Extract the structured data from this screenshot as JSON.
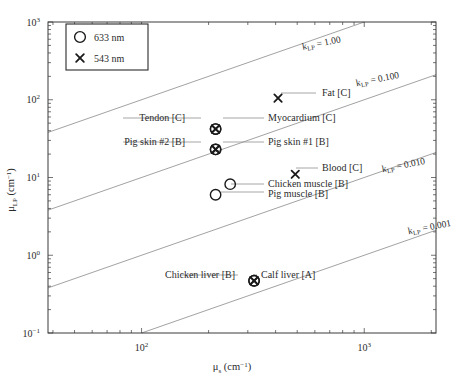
{
  "chart_data": {
    "type": "scatter",
    "title": "",
    "xlabel": "μₛ (cm⁻¹)",
    "ylabel": "μʟₚ (cm⁻¹)",
    "xlabel_parts": {
      "mu": "μ",
      "sub": "s",
      "unit": " (cm",
      "exp": "−1",
      "close": ")"
    },
    "ylabel_parts": {
      "mu": "μ",
      "sub": "LP",
      "unit": " (cm",
      "exp": "−1",
      "close": ")"
    },
    "xscale": "log",
    "yscale": "log",
    "xlim": [
      38,
      2100
    ],
    "ylim": [
      0.1,
      1000
    ],
    "grid": false,
    "xticks": [
      100,
      1000
    ],
    "xtick_labels": [
      "10²",
      "10³"
    ],
    "xtick_label_parts": [
      {
        "base": "10",
        "exp": "2"
      },
      {
        "base": "10",
        "exp": "3"
      }
    ],
    "yticks": [
      0.1,
      1,
      10,
      100,
      1000
    ],
    "ytick_labels": [
      "10⁻¹",
      "10⁰",
      "10¹",
      "10²",
      "10³"
    ],
    "ytick_label_parts": [
      {
        "base": "10",
        "exp": "−1"
      },
      {
        "base": "10",
        "exp": "0"
      },
      {
        "base": "10",
        "exp": "1"
      },
      {
        "base": "10",
        "exp": "2"
      },
      {
        "base": "10",
        "exp": "3"
      }
    ],
    "legend": {
      "position": "top-left",
      "entries": [
        {
          "marker": "circle",
          "label": "633 nm"
        },
        {
          "marker": "cross",
          "label": "543 nm"
        }
      ]
    },
    "reference_lines": [
      {
        "label": "k_LP = 1.00",
        "label_base": "k",
        "label_sub": "LP",
        "label_value": " = 1.00",
        "k": 1.0
      },
      {
        "label": "k_LP = 0.100",
        "label_base": "k",
        "label_sub": "LP",
        "label_value": " = 0.100",
        "k": 0.1
      },
      {
        "label": "k_LP = 0.010",
        "label_base": "k",
        "label_sub": "LP",
        "label_value": " = 0.010",
        "k": 0.01
      },
      {
        "label": "k_LP = 0.001",
        "label_base": "k",
        "label_sub": "LP",
        "label_value": " = 0.001",
        "k": 0.001
      }
    ],
    "points": [
      {
        "name": "Fat [C]",
        "x": 410,
        "y": 105,
        "markers": [
          "cross"
        ],
        "label_side": "right"
      },
      {
        "name": "Tendon [C]",
        "x": 215,
        "y": 42,
        "markers": [
          "circle",
          "cross"
        ],
        "label_side": "left"
      },
      {
        "name": "Myocardium [C]",
        "x": 215,
        "y": 42,
        "markers": [
          "circle",
          "cross"
        ],
        "label_side": "right"
      },
      {
        "name": "Pig skin #2 [B]",
        "x": 215,
        "y": 23,
        "markers": [
          "circle",
          "cross"
        ],
        "label_side": "left"
      },
      {
        "name": "Pig skin #1 [B]",
        "x": 215,
        "y": 23,
        "markers": [
          "circle",
          "cross"
        ],
        "label_side": "right"
      },
      {
        "name": "Blood [C]",
        "x": 490,
        "y": 11,
        "markers": [
          "cross"
        ],
        "label_side": "right"
      },
      {
        "name": "Chicken muscle [B]",
        "x": 250,
        "y": 8.2,
        "markers": [
          "circle"
        ],
        "label_side": "right"
      },
      {
        "name": "Pig muscle [B]",
        "x": 215,
        "y": 6.0,
        "markers": [
          "circle"
        ],
        "label_side": "right"
      },
      {
        "name": "Chicken liver [B]",
        "x": 320,
        "y": 0.47,
        "markers": [
          "circle",
          "cross"
        ],
        "label_side": "left"
      },
      {
        "name": "Calf liver [A]",
        "x": 320,
        "y": 0.47,
        "markers": [
          "circle",
          "cross"
        ],
        "label_side": "right"
      }
    ]
  },
  "colors": {
    "axis": "#3a3a3a",
    "line": "#8a8a8a",
    "marker": "#1a1a1a",
    "text": "#2b2b2b",
    "background": "#ffffff"
  }
}
